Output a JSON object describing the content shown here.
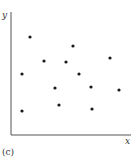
{
  "chart_data": {
    "type": "scatter",
    "title": "",
    "xlabel": "x",
    "ylabel": "y",
    "panel_label": "(c)",
    "grid": false,
    "legend": null,
    "axis_ticks": false,
    "xlim": [
      0,
      120
    ],
    "ylim": [
      0,
      124
    ],
    "points": [
      {
        "x": 19,
        "y": 98
      },
      {
        "x": 62,
        "y": 89
      },
      {
        "x": 33,
        "y": 74
      },
      {
        "x": 55,
        "y": 73
      },
      {
        "x": 99,
        "y": 77
      },
      {
        "x": 11,
        "y": 61
      },
      {
        "x": 68,
        "y": 61
      },
      {
        "x": 44,
        "y": 47
      },
      {
        "x": 80,
        "y": 48
      },
      {
        "x": 108,
        "y": 45
      },
      {
        "x": 11,
        "y": 24
      },
      {
        "x": 48,
        "y": 30
      },
      {
        "x": 81,
        "y": 26
      }
    ],
    "marker_color": "#1a1a1a",
    "axis_color": "#555555"
  }
}
